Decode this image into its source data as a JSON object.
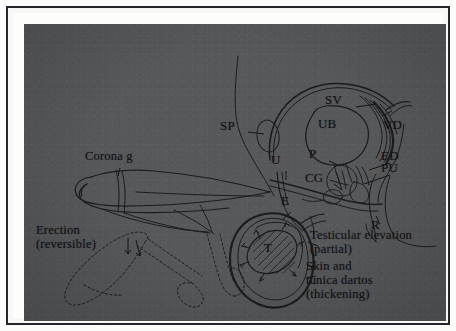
{
  "figure": {
    "kind": "anatomical-line-diagram",
    "background_color": "#56585a",
    "ink_color": "#1b1b20",
    "frame": {
      "outer_margin_color": "#fbfbfa",
      "border_color": "#24242a",
      "mat_color": "#fdfdfc"
    }
  },
  "labels": {
    "abbreviations": [
      {
        "id": "sp",
        "text": "SP",
        "x": 207,
        "y": 106
      },
      {
        "id": "sv",
        "text": "SV",
        "x": 312,
        "y": 80
      },
      {
        "id": "ub",
        "text": "UB",
        "x": 305,
        "y": 104
      },
      {
        "id": "vd",
        "text": "VD",
        "x": 370,
        "y": 105
      },
      {
        "id": "p",
        "text": "P",
        "x": 296,
        "y": 134
      },
      {
        "id": "ed",
        "text": "ED",
        "x": 368,
        "y": 136
      },
      {
        "id": "pu",
        "text": "PU",
        "x": 368,
        "y": 148
      },
      {
        "id": "cg",
        "text": "CG",
        "x": 292,
        "y": 158
      },
      {
        "id": "u",
        "text": "U",
        "x": 258,
        "y": 140
      },
      {
        "id": "e",
        "text": "E",
        "x": 268,
        "y": 181
      },
      {
        "id": "t",
        "text": "T",
        "x": 251,
        "y": 228
      },
      {
        "id": "r",
        "text": "R",
        "x": 358,
        "y": 205
      }
    ],
    "annotations": [
      {
        "id": "corona",
        "text": "Corona g",
        "x": 72,
        "y": 136,
        "align": "left"
      },
      {
        "id": "erection",
        "text": "Erection\n(reversible)",
        "x": 23,
        "y": 210,
        "align": "left"
      },
      {
        "id": "testicular",
        "text": "Testicular elevation\n(partial)",
        "x": 297,
        "y": 215,
        "align": "left"
      },
      {
        "id": "skin",
        "text": "Skin and\ntunica dartos\n(thickening)",
        "x": 293,
        "y": 246,
        "align": "left"
      }
    ]
  }
}
